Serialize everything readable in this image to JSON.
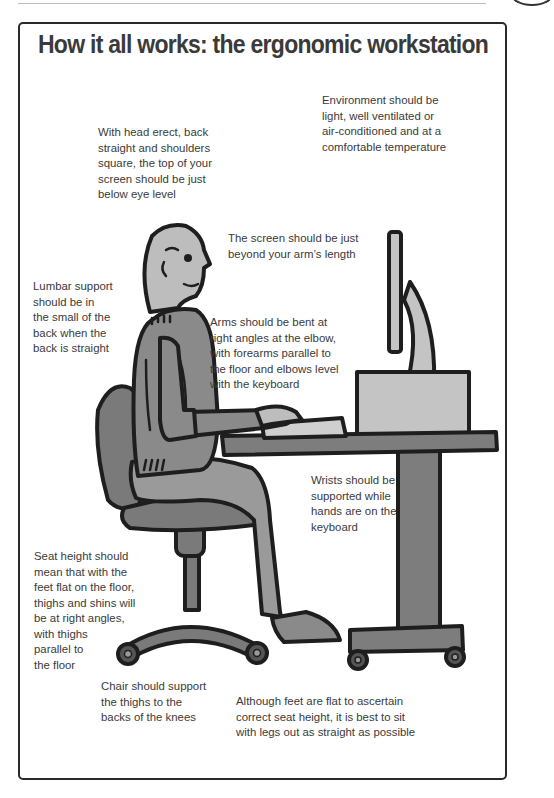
{
  "page": {
    "title": "How it all works: the ergonomic workstation"
  },
  "notes": {
    "environment": "Environment should be\nlight, well ventilated or\nair-conditioned and at a\ncomfortable temperature",
    "head": "With head erect, back\nstraight  and shoulders\nsquare, the top of your\nscreen should be just\nbelow eye level",
    "screen": "The screen should be just\nbeyond your arm’s length",
    "lumbar": "Lumbar support\nshould be in\nthe small of the\nback when the\nback is straight",
    "arms": "Arms should be bent at\nright angles at the elbow,\nwith forearms parallel to\nthe floor and elbows level\nwith the keyboard",
    "wrists": "Wrists should be\nsupported while\nhands are on the\nkeyboard",
    "seat": "Seat height should\nmean that with the\nfeet flat on the floor,\nthighs and shins will\nbe at right angles,\nwith thighs\nparallel to\nthe floor",
    "chair": "Chair should support\nthe thighs to the\nbacks of the knees",
    "feet": "Although feet are flat to ascertain\ncorrect seat height, it is best to sit\nwith legs out as straight as possible"
  },
  "illustration": {
    "subject": "person-seated-at-computer-desk",
    "colors": {
      "outline": "#1e1e1e",
      "skin": "#bdbdbd",
      "sweater": "#8a8a8a",
      "trousers": "#9a9a9a",
      "chair": "#7a7a7a",
      "desk": "#7d7d7d",
      "monitor": "#c4c4c4",
      "keyboard": "#cfcfcf"
    }
  }
}
